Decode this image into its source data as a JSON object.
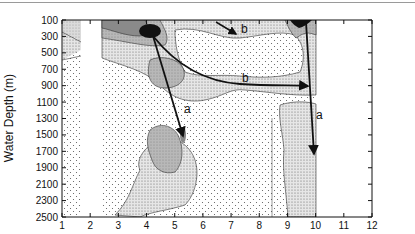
{
  "chart_data": {
    "type": "heatmap",
    "subtype": "filled contour",
    "title": "",
    "xlabel": "Month",
    "ylabel": "Water Depth (m)",
    "xlim": [
      1,
      12
    ],
    "ylim": [
      2500,
      100
    ],
    "y_inverted": true,
    "x_ticks": [
      "1",
      "2",
      "3",
      "4",
      "5",
      "6",
      "7",
      "8",
      "9",
      "10",
      "11",
      "12"
    ],
    "y_ticks": [
      "100",
      "300",
      "500",
      "700",
      "900",
      "1100",
      "1300",
      "1500",
      "1700",
      "1900",
      "2100",
      "2300",
      "2500"
    ],
    "data_coverage_months": [
      [
        1,
        1.65
      ],
      [
        2.4,
        10
      ]
    ],
    "shading_levels": [
      "lowest (sparse dots)",
      "low (dense dots)",
      "medium (light gray)",
      "high (dark gray)",
      "maximum (black)"
    ],
    "maxima": [
      {
        "month": 4,
        "depth_m": 300,
        "level": "maximum"
      },
      {
        "month": 9.3,
        "depth_m": 100,
        "level": "maximum"
      },
      {
        "month": 5,
        "depth_m": 1650,
        "level": "high"
      }
    ],
    "annotations": [
      {
        "label": "a",
        "from": {
          "month": 4,
          "depth_m": 300
        },
        "to": {
          "month": 5,
          "depth_m": 1700
        }
      },
      {
        "label": "a",
        "from": {
          "month": 9.1,
          "depth_m": 100
        },
        "to": {
          "month": 9.3,
          "depth_m": 2050
        }
      },
      {
        "label": "b",
        "from": {
          "month": 4,
          "depth_m": 300
        },
        "to": {
          "month": 9,
          "depth_m": 1050
        }
      },
      {
        "label": "b",
        "from": {
          "month": 5.8,
          "depth_m": 100
        },
        "to": {
          "month": 6.7,
          "depth_m": 300
        }
      }
    ],
    "grid": false,
    "legend": "none"
  },
  "labels": {
    "xlabel": "Month",
    "ylabel": "Water Depth (m)",
    "a": "a",
    "b": "b"
  }
}
